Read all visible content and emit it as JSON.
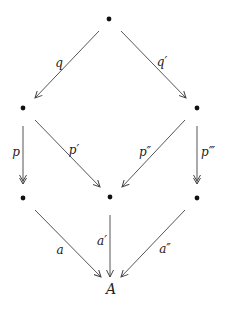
{
  "diagram": {
    "type": "commutative-diagram",
    "nodes": [
      {
        "id": "top",
        "label": "•",
        "x": 109,
        "y": 19
      },
      {
        "id": "mid_left",
        "label": "•",
        "x": 23,
        "y": 108
      },
      {
        "id": "mid_right",
        "label": "•",
        "x": 197,
        "y": 108
      },
      {
        "id": "bot_left",
        "label": "•",
        "x": 23,
        "y": 198
      },
      {
        "id": "bot_center",
        "label": "•",
        "x": 110,
        "y": 197
      },
      {
        "id": "bot_right",
        "label": "•",
        "x": 197,
        "y": 198
      },
      {
        "id": "A",
        "label": "A",
        "x": 111,
        "y": 289
      }
    ],
    "arrows": [
      {
        "from": "top",
        "to": "mid_left",
        "label": "q",
        "head": "single"
      },
      {
        "from": "top",
        "to": "mid_right",
        "label": "q′",
        "head": "single"
      },
      {
        "from": "mid_left",
        "to": "bot_left",
        "label": "p",
        "head": "double"
      },
      {
        "from": "mid_left",
        "to": "bot_center",
        "label": "p′",
        "head": "single"
      },
      {
        "from": "mid_right",
        "to": "bot_center",
        "label": "p″",
        "head": "single"
      },
      {
        "from": "mid_right",
        "to": "bot_right",
        "label": "p‴",
        "head": "double"
      },
      {
        "from": "bot_left",
        "to": "A",
        "label": "a",
        "head": "single"
      },
      {
        "from": "bot_center",
        "to": "A",
        "label": "a′",
        "head": "single"
      },
      {
        "from": "bot_right",
        "to": "A",
        "label": "a″",
        "head": "single"
      }
    ]
  },
  "labels": {
    "q": "q",
    "q_prime": "q′",
    "p": "p",
    "p_prime": "p′",
    "p_double_prime": "p″",
    "p_triple_prime": "p‴",
    "a": "a",
    "a_prime": "a′",
    "a_double_prime": "a″",
    "A": "A"
  },
  "colors": {
    "ink": "#333333",
    "background": "#ffffff"
  }
}
